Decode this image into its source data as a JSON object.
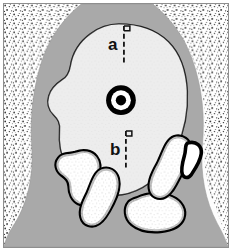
{
  "figure": {
    "type": "anatomical-cross-section-diagram",
    "labels": [
      {
        "id": "a",
        "text": "a",
        "role": "measurement-caliper-upper"
      },
      {
        "id": "b",
        "text": "b",
        "role": "measurement-caliper-lower"
      }
    ],
    "markers": {
      "center_target": "bullseye-marker",
      "caliper_flag": "caliper-flag-marker"
    }
  },
  "colors": {
    "background": "#fdfdfd",
    "frame_border": "#8e8e8e",
    "matrix_gray": "#a9a9a9",
    "inner_pale": "#e9e9e9",
    "outline_black": "#000000",
    "stipple": "#2a2a2a",
    "label_text": "#111111"
  },
  "geometry": {
    "width": 233,
    "height": 251,
    "center_target": {
      "cx": 122,
      "cy": 100,
      "r_outer": 15,
      "r_mid": 10,
      "r_inner": 5
    },
    "caliper_a": {
      "x": 124,
      "y_top": 24,
      "y_bottom": 62
    },
    "caliper_b": {
      "x": 126,
      "y_top": 130,
      "y_bottom": 168
    }
  }
}
